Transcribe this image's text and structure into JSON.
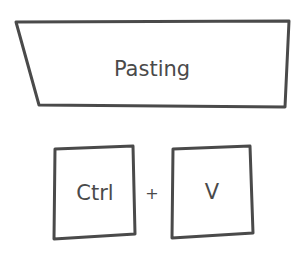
{
  "title_shape": {
    "label": "Pasting",
    "points": "16,22 289,21 285,107 39,105",
    "center": [
      152,
      69
    ]
  },
  "keys": [
    {
      "id": "ctrl",
      "label": "Ctrl",
      "points": "55,149 133,146 135,234 54,239",
      "center": [
        95,
        193
      ]
    },
    {
      "id": "v",
      "label": "V",
      "points": "173,149 250,146 253,233 172,238",
      "center": [
        212,
        192
      ]
    }
  ],
  "operator": {
    "label": "+",
    "center": [
      152,
      193
    ]
  },
  "colors": {
    "stroke": "#4a4a4a",
    "fill": "#ffffff",
    "text": "#4a4a4a"
  }
}
